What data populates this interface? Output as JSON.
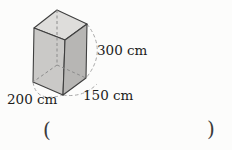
{
  "figure": {
    "shape": "rectangular-prism",
    "labels": {
      "height": "300 cm",
      "width": "200 cm",
      "depth": "150 cm"
    },
    "dimensions_cm": {
      "height": 300,
      "width": 200,
      "depth": 150
    },
    "answer_blank": {
      "open": "(",
      "close": ")"
    },
    "colors": {
      "background": "#fcfcfb",
      "top_face": "#dedddb",
      "left_face": "#cac9c7",
      "right_face": "#b7b6b4",
      "edge": "#3f3f3f",
      "hidden_edge": "#8c8c8c",
      "dimension_line": "#a8a8a8",
      "text": "#1d1d1b",
      "paren": "#3a3a3a"
    }
  }
}
